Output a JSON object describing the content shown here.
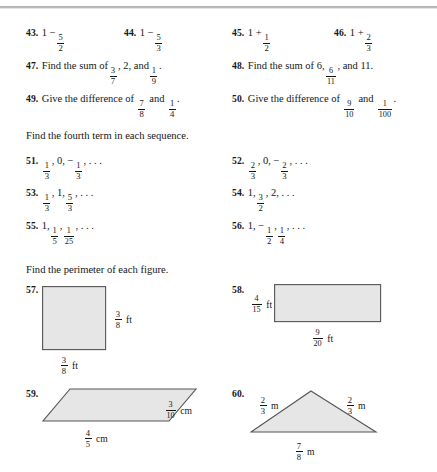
{
  "page": {
    "kind": "math-worksheet-scan",
    "width": 437,
    "height": 472,
    "fill_color": "#e6e6e6",
    "stroke_color": "#555555"
  },
  "exercises": {
    "row1": [
      {
        "number": "43.",
        "prefix": "1 −",
        "frac": {
          "n": "5",
          "d": "2"
        },
        "suffix": ""
      },
      {
        "number": "44.",
        "prefix": "1 −",
        "frac": {
          "n": "5",
          "d": "3"
        },
        "suffix": ""
      },
      {
        "number": "45.",
        "prefix": "1 +",
        "frac": {
          "n": "1",
          "d": "2"
        },
        "suffix": ""
      },
      {
        "number": "46.",
        "prefix": "1 +",
        "frac": {
          "n": "2",
          "d": "3"
        },
        "suffix": ""
      }
    ],
    "p47": {
      "number": "47.",
      "lead": "Find the sum of",
      "frac1": {
        "n": "3",
        "d": "7"
      },
      "mid": ", 2, and",
      "frac2": {
        "n": "1",
        "d": "9"
      },
      "end": "."
    },
    "p48": {
      "number": "48.",
      "lead": "Find the sum of 6,",
      "frac1": {
        "n": "6",
        "d": "11"
      },
      "mid": ", and 11.",
      "frac2": null,
      "end": ""
    },
    "p49": {
      "number": "49.",
      "lead": "Give the difference of",
      "frac1": {
        "n": "7",
        "d": "8"
      },
      "mid": "and",
      "frac2": {
        "n": "1",
        "d": "4"
      },
      "end": "."
    },
    "p50": {
      "number": "50.",
      "lead": "Give the difference of",
      "frac1": {
        "n": "9",
        "d": "10"
      },
      "mid": "and",
      "frac2": {
        "n": "1",
        "d": "100"
      },
      "end": "."
    }
  },
  "headings": {
    "sequences": "Find the fourth term in each sequence.",
    "perimeter": "Find the perimeter of each figure."
  },
  "sequences": {
    "p51": {
      "number": "51.",
      "terms": [
        "1/3",
        "0",
        "−1/3"
      ],
      "ellipsis": ", . . ."
    },
    "p52": {
      "number": "52.",
      "terms": [
        "2/3",
        "0",
        "−2/3"
      ],
      "ellipsis": ", . . ."
    },
    "p53": {
      "number": "53.",
      "terms": [
        "1/3",
        "1",
        "5/3"
      ],
      "ellipsis": ", . . ."
    },
    "p54": {
      "number": "54.",
      "terms": [
        "1",
        "3/2",
        "2"
      ],
      "ellipsis": ", . . ."
    },
    "p55": {
      "number": "55.",
      "terms": [
        "1",
        "1/5",
        "1/25"
      ],
      "ellipsis": ", . . ."
    },
    "p56": {
      "number": "56.",
      "terms": [
        "1",
        "−1/2",
        "1/4"
      ],
      "ellipsis": ", . . ."
    }
  },
  "figures": {
    "p57": {
      "number": "57.",
      "shape": "square",
      "right_label": {
        "n": "3",
        "d": "8",
        "unit": "ft"
      },
      "bottom_label": {
        "n": "3",
        "d": "8",
        "unit": "ft"
      }
    },
    "p58": {
      "number": "58.",
      "shape": "rectangle",
      "left_label": {
        "n": "4",
        "d": "15",
        "unit": "ft"
      },
      "bottom_label": {
        "n": "9",
        "d": "20",
        "unit": "ft"
      }
    },
    "p59": {
      "number": "59.",
      "shape": "parallelogram",
      "right_label": {
        "n": "3",
        "d": "10",
        "unit": "cm"
      },
      "bottom_label": {
        "n": "4",
        "d": "5",
        "unit": "cm"
      }
    },
    "p60": {
      "number": "60.",
      "shape": "triangle",
      "left_label": {
        "n": "2",
        "d": "3",
        "unit": "m"
      },
      "right_label": {
        "n": "2",
        "d": "3",
        "unit": "m"
      },
      "bottom_label": {
        "n": "7",
        "d": "8",
        "unit": "m"
      }
    }
  }
}
